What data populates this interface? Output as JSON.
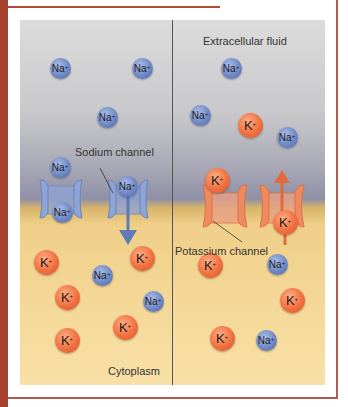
{
  "labels": {
    "extracellular": "Extracellular fluid",
    "cytoplasm": "Cytoplasm",
    "sodium_channel": "Sodium channel",
    "potassium_channel": "Potassium channel"
  },
  "colors": {
    "frame": "#a8402e",
    "sodium": "#6f88c6",
    "potassium": "#f0703f",
    "extracellular_bg": "#c9c9cc",
    "cytoplasm_bg": "#f5d99a"
  },
  "ions": [
    {
      "type": "na",
      "symbol": "Na",
      "charge": "+",
      "x": 40,
      "y": 48
    },
    {
      "type": "na",
      "symbol": "Na",
      "charge": "+",
      "x": 122,
      "y": 48
    },
    {
      "type": "na",
      "symbol": "Na",
      "charge": "+",
      "x": 87,
      "y": 97
    },
    {
      "type": "na",
      "symbol": "Na",
      "charge": "+",
      "x": 40,
      "y": 147
    },
    {
      "type": "na",
      "symbol": "Na",
      "charge": "+",
      "x": 107,
      "y": 166
    },
    {
      "type": "na",
      "symbol": "Na",
      "charge": "+",
      "x": 42,
      "y": 192
    },
    {
      "type": "k",
      "symbol": "K",
      "charge": "+",
      "x": 26,
      "y": 242
    },
    {
      "type": "k",
      "symbol": "K",
      "charge": "+",
      "x": 122,
      "y": 238
    },
    {
      "type": "na",
      "symbol": "Na",
      "charge": "+",
      "x": 82,
      "y": 255
    },
    {
      "type": "k",
      "symbol": "K",
      "charge": "+",
      "x": 47,
      "y": 277
    },
    {
      "type": "na",
      "symbol": "Na",
      "charge": "+",
      "x": 133,
      "y": 281
    },
    {
      "type": "k",
      "symbol": "K",
      "charge": "+",
      "x": 105,
      "y": 307
    },
    {
      "type": "k",
      "symbol": "K",
      "charge": "+",
      "x": 47,
      "y": 320
    },
    {
      "type": "na",
      "symbol": "Na",
      "charge": "+",
      "x": 211,
      "y": 48
    },
    {
      "type": "na",
      "symbol": "Na",
      "charge": "+",
      "x": 180,
      "y": 95
    },
    {
      "type": "k",
      "symbol": "K",
      "charge": "+",
      "x": 230,
      "y": 105
    },
    {
      "type": "na",
      "symbol": "Na",
      "charge": "+",
      "x": 267,
      "y": 117
    },
    {
      "type": "k",
      "symbol": "K",
      "charge": "+",
      "x": 197,
      "y": 160
    },
    {
      "type": "k",
      "symbol": "K",
      "charge": "+",
      "x": 265,
      "y": 202
    },
    {
      "type": "k",
      "symbol": "K",
      "charge": "+",
      "x": 190,
      "y": 245
    },
    {
      "type": "na",
      "symbol": "Na",
      "charge": "+",
      "x": 257,
      "y": 244
    },
    {
      "type": "k",
      "symbol": "K",
      "charge": "+",
      "x": 272,
      "y": 280
    },
    {
      "type": "k",
      "symbol": "K",
      "charge": "+",
      "x": 202,
      "y": 318
    },
    {
      "type": "na",
      "symbol": "Na",
      "charge": "+",
      "x": 246,
      "y": 320
    }
  ]
}
